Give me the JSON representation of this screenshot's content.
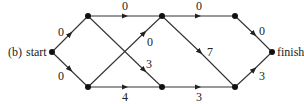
{
  "diagram": {
    "caption": "(b)",
    "nodes": [
      {
        "id": "start",
        "label": "start",
        "x": 52,
        "y": 52
      },
      {
        "id": "a",
        "label": "",
        "x": 88,
        "y": 16
      },
      {
        "id": "b",
        "label": "",
        "x": 88,
        "y": 87
      },
      {
        "id": "c",
        "label": "",
        "x": 162,
        "y": 16
      },
      {
        "id": "d",
        "label": "",
        "x": 162,
        "y": 87
      },
      {
        "id": "e",
        "label": "",
        "x": 235,
        "y": 16
      },
      {
        "id": "f",
        "label": "",
        "x": 235,
        "y": 87
      },
      {
        "id": "finish",
        "label": "finish",
        "x": 272,
        "y": 52
      }
    ],
    "edges": [
      {
        "from": "start",
        "to": "a",
        "weight": "0"
      },
      {
        "from": "start",
        "to": "b",
        "weight": "0"
      },
      {
        "from": "a",
        "to": "c",
        "weight": "0"
      },
      {
        "from": "a",
        "to": "d",
        "weight": "3"
      },
      {
        "from": "b",
        "to": "c",
        "weight": "0"
      },
      {
        "from": "b",
        "to": "d",
        "weight": "4"
      },
      {
        "from": "c",
        "to": "e",
        "weight": "0"
      },
      {
        "from": "c",
        "to": "f",
        "weight": "7"
      },
      {
        "from": "d",
        "to": "f",
        "weight": "3"
      },
      {
        "from": "e",
        "to": "finish",
        "weight": "0"
      },
      {
        "from": "f",
        "to": "finish",
        "weight": "3"
      }
    ]
  }
}
